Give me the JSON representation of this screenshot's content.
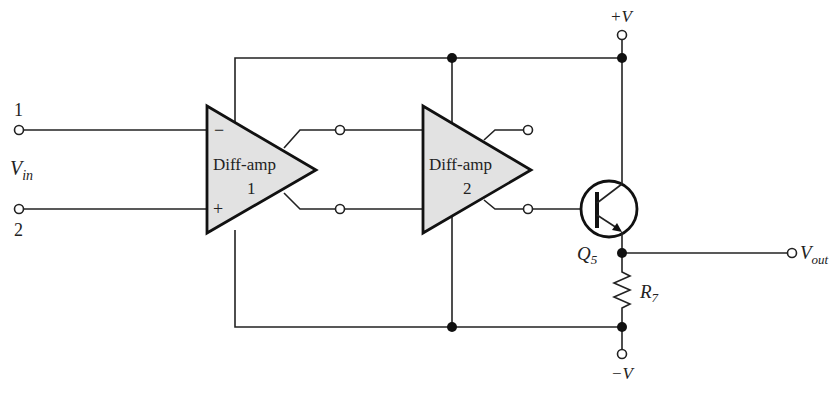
{
  "diagram": {
    "type": "circuit-schematic",
    "title": "",
    "inputs": {
      "terminal1": "1",
      "terminal2": "2",
      "vin_main": "V",
      "vin_sub": "in"
    },
    "amp1": {
      "name": "Diff-amp",
      "number": "1",
      "minus": "−",
      "plus": "+"
    },
    "amp2": {
      "name": "Diff-amp",
      "number": "2"
    },
    "transistor": {
      "main": "Q",
      "sub": "5"
    },
    "resistor": {
      "main": "R",
      "sub": "7"
    },
    "supply": {
      "positive": "+V",
      "negative": "−V"
    },
    "output": {
      "main": "V",
      "sub": "out"
    },
    "colors": {
      "amp_fill": "#e2e2e2",
      "line": "#222222",
      "background": "#ffffff"
    }
  }
}
